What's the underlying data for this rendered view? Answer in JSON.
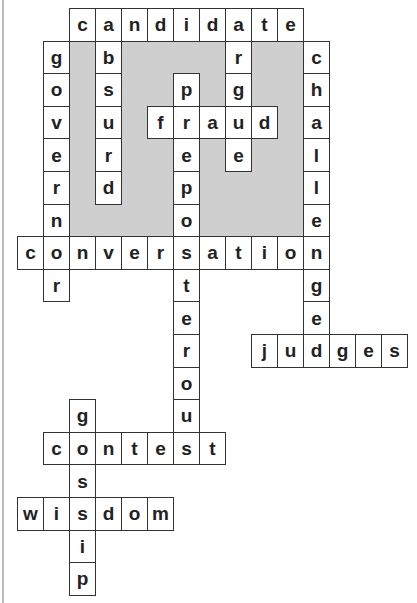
{
  "puzzle": {
    "type": "crossword-solution",
    "grid": {
      "cols": 15,
      "rows": 18,
      "origin_x": 17,
      "origin_y": 8,
      "cell_w": 26,
      "cell_h": 32.6
    },
    "shaded_region": {
      "col": 2,
      "row": 1,
      "cols": 9,
      "rows": 6,
      "color": "#cfcfcf"
    },
    "words": [
      {
        "word": "candidate",
        "dir": "across",
        "col": 2,
        "row": 0
      },
      {
        "word": "fraud",
        "dir": "across",
        "col": 5,
        "row": 3
      },
      {
        "word": "conversation",
        "dir": "across",
        "col": 0,
        "row": 7
      },
      {
        "word": "judges",
        "dir": "across",
        "col": 9,
        "row": 10
      },
      {
        "word": "contest",
        "dir": "across",
        "col": 1,
        "row": 13
      },
      {
        "word": "wisdom",
        "dir": "across",
        "col": 0,
        "row": 15
      },
      {
        "word": "governor",
        "dir": "down",
        "col": 1,
        "row": 1
      },
      {
        "word": "absurd",
        "dir": "down",
        "col": 3,
        "row": 0
      },
      {
        "word": "preposterous",
        "dir": "down",
        "col": 6,
        "row": 2
      },
      {
        "word": "argue",
        "dir": "down",
        "col": 8,
        "row": 0
      },
      {
        "word": "challenge",
        "dir": "down",
        "col": 11,
        "row": 1
      },
      {
        "word": "gossip",
        "dir": "down",
        "col": 2,
        "row": 12
      }
    ]
  }
}
